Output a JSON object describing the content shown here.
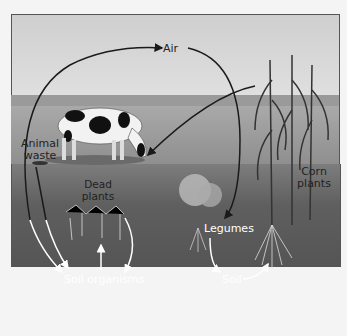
{
  "labels": {
    "air": "Air",
    "animal_waste_1": "Animal",
    "animal_waste_2": "waste",
    "dead_plants_1": "Dead",
    "dead_plants_2": "plants",
    "corn_plants_1": "Corn",
    "corn_plants_2": "plants",
    "legumes": "Legumes",
    "soil_organisms": "Soil organisms",
    "soil": "Soil"
  },
  "colors": {
    "sky": "#dcdcdc",
    "hill": "#9a9a9a",
    "ground": "#a0a0a0",
    "soil": "#5e5e5e",
    "arrow_dark": "#1a1a1a",
    "arrow_light": "#ffffff"
  }
}
